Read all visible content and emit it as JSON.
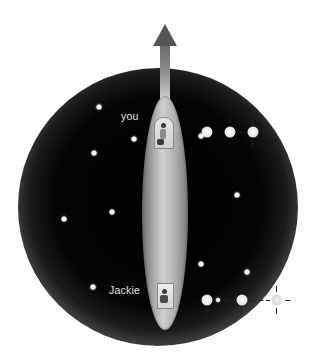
{
  "diagram": {
    "labels": {
      "top_observer": "you",
      "bottom_observer": "Jackie"
    },
    "arrow": {
      "direction": "up",
      "icon": "arrow-up-icon"
    },
    "colors": {
      "space": "#000000",
      "sphere_edge": "#ffffff",
      "ship": "#b0b0b0",
      "arrow": "#555555",
      "star": "#f4f4f4",
      "label_text": "#e6e6e6"
    },
    "stars": [
      {
        "x": 99,
        "y": 107
      },
      {
        "x": 134,
        "y": 139
      },
      {
        "x": 94,
        "y": 153
      },
      {
        "x": 112,
        "y": 212
      },
      {
        "x": 64,
        "y": 219
      },
      {
        "x": 237,
        "y": 195
      },
      {
        "x": 201,
        "y": 264
      },
      {
        "x": 247,
        "y": 272
      },
      {
        "x": 93,
        "y": 287
      },
      {
        "x": 201,
        "y": 136
      },
      {
        "x": 218,
        "y": 300
      }
    ],
    "light_pulses_top": [
      {
        "x": 207,
        "y": 132,
        "ticks": false
      },
      {
        "x": 230,
        "y": 132,
        "ticks": true
      },
      {
        "x": 253,
        "y": 132,
        "ticks": true
      }
    ],
    "light_pulses_bottom": [
      {
        "x": 207,
        "y": 300,
        "ticks": true
      },
      {
        "x": 242,
        "y": 300,
        "ticks": true
      },
      {
        "x": 277,
        "y": 300,
        "ticks": true,
        "faint": true
      }
    ]
  }
}
